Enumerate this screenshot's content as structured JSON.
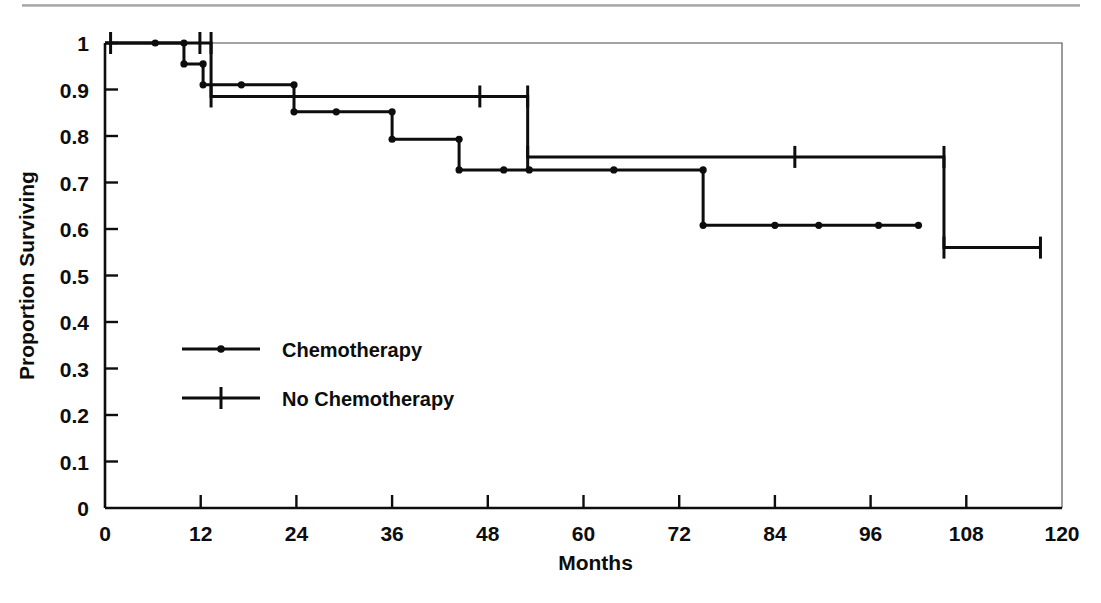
{
  "figure": {
    "kind": "kaplan-meier-survival-plot",
    "background_color": "#ffffff",
    "ink_color": "#0d0d0d"
  },
  "chart_data": {
    "type": "line",
    "subtype": "kaplan-meier step curve",
    "title": "",
    "subtitle": "",
    "xlabel": "Months",
    "ylabel": "Proportion Surviving",
    "xlim": [
      0,
      120
    ],
    "ylim": [
      0,
      1
    ],
    "grid": false,
    "legend_position": "inside-lower-left",
    "x_ticks": [
      0,
      12,
      24,
      36,
      48,
      60,
      72,
      84,
      96,
      108,
      120
    ],
    "x_tick_labels": [
      "0",
      "12",
      "24",
      "36",
      "48",
      "60",
      "72",
      "84",
      "96",
      "108",
      "120"
    ],
    "y_ticks": [
      0,
      0.1,
      0.2,
      0.3,
      0.4,
      0.5,
      0.6,
      0.7,
      0.8,
      0.9,
      1
    ],
    "y_tick_labels": [
      "0",
      "0.1",
      "0.2",
      "0.3",
      "0.4",
      "0.5",
      "0.6",
      "0.7",
      "0.8",
      "0.9",
      "1"
    ],
    "series": [
      {
        "name": "Chemotherapy",
        "marker": "dot",
        "steps": [
          {
            "x": 0,
            "y": 1.0
          },
          {
            "x": 9.9,
            "y": 1.0
          },
          {
            "x": 9.9,
            "y": 0.955
          },
          {
            "x": 12.3,
            "y": 0.955
          },
          {
            "x": 12.3,
            "y": 0.91
          },
          {
            "x": 23.7,
            "y": 0.91
          },
          {
            "x": 23.7,
            "y": 0.852
          },
          {
            "x": 36.0,
            "y": 0.852
          },
          {
            "x": 36.0,
            "y": 0.793
          },
          {
            "x": 44.4,
            "y": 0.793
          },
          {
            "x": 44.4,
            "y": 0.727
          },
          {
            "x": 75.0,
            "y": 0.727
          },
          {
            "x": 75.0,
            "y": 0.608
          },
          {
            "x": 102.0,
            "y": 0.608
          }
        ],
        "event_points": [
          {
            "x": 9.9,
            "y": 1.0
          },
          {
            "x": 9.9,
            "y": 0.955
          },
          {
            "x": 12.3,
            "y": 0.955
          },
          {
            "x": 12.3,
            "y": 0.91
          },
          {
            "x": 23.7,
            "y": 0.91
          },
          {
            "x": 23.7,
            "y": 0.852
          },
          {
            "x": 36.0,
            "y": 0.852
          },
          {
            "x": 36.0,
            "y": 0.793
          },
          {
            "x": 44.4,
            "y": 0.793
          },
          {
            "x": 44.4,
            "y": 0.727
          },
          {
            "x": 75.0,
            "y": 0.727
          },
          {
            "x": 75.0,
            "y": 0.608
          },
          {
            "x": 102.0,
            "y": 0.608
          }
        ],
        "censored_points": [
          {
            "x": 6.3,
            "y": 1.0
          },
          {
            "x": 17.1,
            "y": 0.91
          },
          {
            "x": 29.0,
            "y": 0.852
          },
          {
            "x": 50.0,
            "y": 0.727
          },
          {
            "x": 53.2,
            "y": 0.727
          },
          {
            "x": 63.8,
            "y": 0.727
          },
          {
            "x": 84.0,
            "y": 0.608
          },
          {
            "x": 89.5,
            "y": 0.608
          },
          {
            "x": 97.0,
            "y": 0.608
          }
        ]
      },
      {
        "name": "No Chemotherapy",
        "marker": "tick",
        "steps": [
          {
            "x": 0,
            "y": 1.0
          },
          {
            "x": 13.3,
            "y": 1.0
          },
          {
            "x": 13.3,
            "y": 0.885
          },
          {
            "x": 53.0,
            "y": 0.885
          },
          {
            "x": 53.0,
            "y": 0.755
          },
          {
            "x": 105.2,
            "y": 0.755
          },
          {
            "x": 105.2,
            "y": 0.56
          },
          {
            "x": 117.3,
            "y": 0.56
          }
        ],
        "censored_points": [
          {
            "x": 0.7,
            "y": 1.0
          },
          {
            "x": 11.9,
            "y": 1.0
          },
          {
            "x": 13.3,
            "y": 1.0
          },
          {
            "x": 13.3,
            "y": 0.885
          },
          {
            "x": 47.0,
            "y": 0.885
          },
          {
            "x": 53.0,
            "y": 0.885
          },
          {
            "x": 53.0,
            "y": 0.755
          },
          {
            "x": 86.5,
            "y": 0.755
          },
          {
            "x": 105.2,
            "y": 0.755
          },
          {
            "x": 105.2,
            "y": 0.56
          },
          {
            "x": 117.3,
            "y": 0.56
          }
        ]
      }
    ]
  },
  "legend": {
    "entries": [
      {
        "label": "Chemotherapy",
        "marker": "dot"
      },
      {
        "label": "No Chemotherapy",
        "marker": "tick"
      }
    ]
  }
}
